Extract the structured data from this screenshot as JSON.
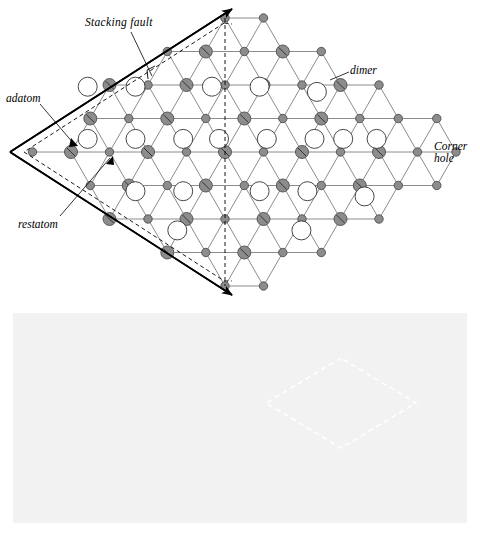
{
  "figure": {
    "name": "si111-7x7-das-model-and-stm",
    "panels": [
      "schematic",
      "stm-image"
    ]
  },
  "schematic": {
    "labels": {
      "stacking_fault": "Stacking  fault",
      "adatom": "adatom",
      "restatom": "restatom",
      "dimer": "dimer",
      "corner_hole_line1": "Corner",
      "corner_hole_line2": "hole"
    },
    "colors": {
      "atom_fill": "#8c8c8c",
      "atom_stroke": "#4d4d4d",
      "adatom_fill": "#ffffff",
      "adatom_stroke": "#333333",
      "bond": "#8c8c8c",
      "bond_dark": "#333333",
      "cell_solid": "#000000",
      "cell_dashed": "#000000",
      "mirror_dashed": "#000000",
      "label_text": "#000000"
    },
    "geometry": {
      "unit_cell_vertices": [
        [
          10,
          152
        ],
        [
          232,
          9
        ],
        [
          454,
          152
        ],
        [
          232,
          295
        ]
      ],
      "arrow_tip_top": [
        233,
        9
      ],
      "arrow_tip_bottom": [
        232,
        295
      ],
      "mirror_line_x": 225,
      "adatom_radius": 9.5,
      "restatom_radius": 6.5,
      "atom_radius": 4.2
    }
  },
  "stm": {
    "caption": "",
    "colors": {
      "background": "#4d4d4d",
      "spot": "#f2f2f2",
      "unit_cell_dash": "#ffffff"
    },
    "geometry": {
      "frame": [
        13,
        313,
        454,
        210
      ],
      "spot_radius": 7.2,
      "lattice_a": 26.6,
      "lattice_rows": 9,
      "unit_cell_vertices": [
        [
          341,
          358
        ],
        [
          266,
          403
        ],
        [
          341,
          448
        ],
        [
          416,
          403
        ]
      ]
    }
  }
}
